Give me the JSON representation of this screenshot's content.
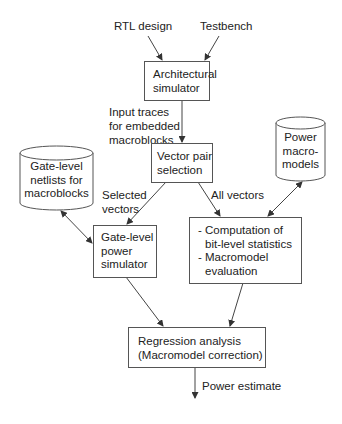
{
  "diagram": {
    "inputs": {
      "rtl": "RTL design",
      "testbench": "Testbench"
    },
    "nodes": {
      "arch_sim": {
        "lines": [
          "Architectural",
          "simulator"
        ]
      },
      "vector_sel": {
        "lines": [
          "Vector pair",
          "selection"
        ]
      },
      "netlists": {
        "lines": [
          "Gate-level",
          "netlists for",
          "macroblocks"
        ]
      },
      "macromodels": {
        "lines": [
          "Power",
          "macro-",
          "models"
        ]
      },
      "gate_sim": {
        "lines": [
          "Gate-level",
          "power",
          "simulator"
        ]
      },
      "computation": {
        "lines": [
          "- Computation of",
          "bit-level statistics",
          "- Macromodel",
          "evaluation"
        ]
      },
      "regression": {
        "lines": [
          "Regression analysis",
          "(Macromodel correction)"
        ]
      }
    },
    "edge_labels": {
      "input_traces": [
        "Input traces",
        "for embedded",
        "macroblocks"
      ],
      "selected_vectors": [
        "Selected",
        "vectors"
      ],
      "all_vectors": "All vectors",
      "power_estimate": "Power estimate"
    },
    "colors": {
      "line": "#444444",
      "text": "#222222",
      "background": "#ffffff"
    }
  }
}
